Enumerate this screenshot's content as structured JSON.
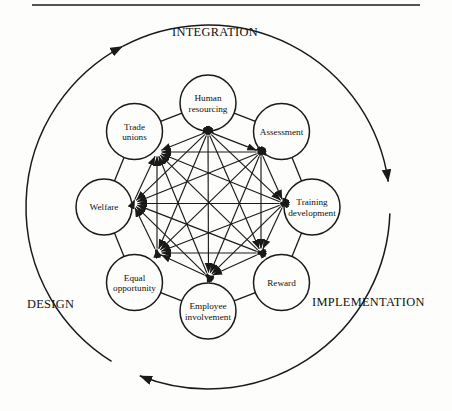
{
  "figure": {
    "rule": {
      "name": "top-horizontal-rule",
      "x1": 32,
      "x2": 420,
      "y": 5
    },
    "colors": {
      "ink": "#1a1a1a",
      "paper": "#fdfdfb"
    },
    "geometry": {
      "center_x": 208,
      "center_y": 207,
      "outer_radius": 182,
      "ring_radius": 77,
      "node_radius": 28,
      "inner_radius": 75.5
    },
    "nodes": [
      {
        "id": "human-resourcing",
        "lines": [
          "Human",
          "resourcing"
        ],
        "angle": -90,
        "cx": 208,
        "cy": 103
      },
      {
        "id": "assessment",
        "lines": [
          "Assessment"
        ],
        "angle": -45,
        "cx": 281.5,
        "cy": 131.5
      },
      {
        "id": "training-development",
        "lines": [
          "Training",
          "development"
        ],
        "angle": 0,
        "cx": 312,
        "cy": 207
      },
      {
        "id": "reward",
        "lines": [
          "Reward"
        ],
        "angle": 45,
        "cx": 281.5,
        "cy": 282.5
      },
      {
        "id": "employee-involvement",
        "lines": [
          "Employee",
          "involvement"
        ],
        "angle": 90,
        "cx": 208,
        "cy": 311
      },
      {
        "id": "equal-opportunity",
        "lines": [
          "Equal",
          "opportunity"
        ],
        "angle": 135,
        "cx": 134.5,
        "cy": 282.5
      },
      {
        "id": "welfare",
        "lines": [
          "Welfare"
        ],
        "angle": 180,
        "cx": 104,
        "cy": 207
      },
      {
        "id": "trade-unions",
        "lines": [
          "Trade",
          "unions"
        ],
        "angle": -135,
        "cx": 134.5,
        "cy": 131.5
      }
    ],
    "inner_vertices": [
      {
        "id": "v-top",
        "x": 208,
        "y": 131.5
      },
      {
        "id": "v-top-right",
        "x": 261,
        "y": 152
      },
      {
        "id": "v-right",
        "x": 284,
        "y": 203.5
      },
      {
        "id": "v-bottom-right",
        "x": 261,
        "y": 253
      },
      {
        "id": "v-bottom",
        "x": 208.5,
        "y": 277
      },
      {
        "id": "v-bottom-left",
        "x": 157,
        "y": 253
      },
      {
        "id": "v-left",
        "x": 133,
        "y": 203.5
      },
      {
        "id": "v-top-left",
        "x": 157,
        "y": 152
      }
    ],
    "phases": [
      {
        "id": "integration",
        "label": "INTEGRATION",
        "x": 215,
        "y": 36,
        "anchor": "middle"
      },
      {
        "id": "implementation",
        "label": "IMPLEMENTATION",
        "x": 312,
        "y": 306,
        "anchor": "start"
      },
      {
        "id": "design",
        "label": "DESIGN",
        "x": 27,
        "y": 308,
        "anchor": "start"
      }
    ],
    "arrows": [
      {
        "id": "arrow-integration",
        "on": "outer-arc",
        "direction": "clockwise",
        "at_degrees": -125
      },
      {
        "id": "arrow-implementation",
        "on": "outer-arc",
        "direction": "clockwise",
        "at_degrees": -5
      },
      {
        "id": "arrow-design",
        "on": "outer-arc",
        "direction": "clockwise",
        "at_degrees": 125
      }
    ]
  }
}
